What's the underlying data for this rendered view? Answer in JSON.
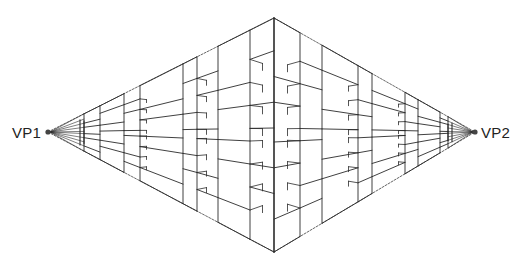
{
  "diagram": {
    "type": "two-point-perspective",
    "labels": {
      "vp1": "VP1",
      "vp2": "VP2"
    },
    "vanishing_points": {
      "vp1": {
        "x": 48,
        "y": 132
      },
      "vp2": {
        "x": 475,
        "y": 132
      }
    },
    "horizon_y": 132,
    "outline": {
      "top": {
        "x": 274,
        "y": 18
      },
      "bottom": {
        "x": 274,
        "y": 252
      }
    },
    "columns_left": [
      274,
      250,
      218,
      197,
      183,
      140,
      124,
      100,
      84
    ],
    "columns_right": [
      274,
      300,
      322,
      358,
      372,
      405,
      418,
      440,
      448
    ],
    "colors": {
      "line": "#2a2a2a",
      "outline": "#555555"
    }
  }
}
